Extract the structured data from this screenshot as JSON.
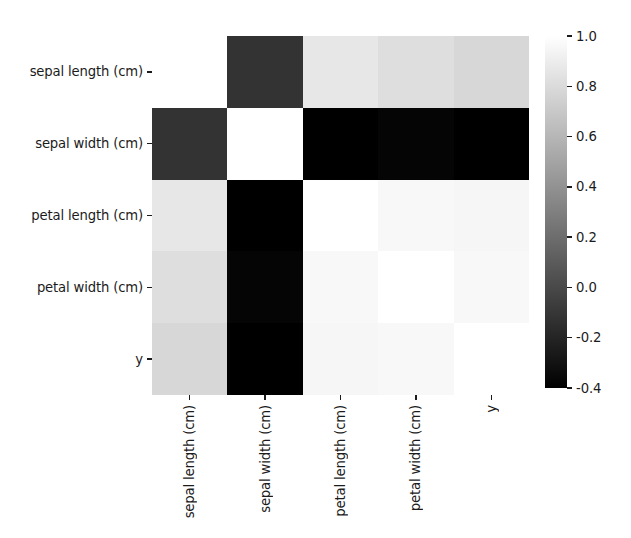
{
  "figure": {
    "kind": "correlation-heatmap",
    "background_color": "#ffffff",
    "text_color": "#1b1b1b"
  },
  "chart_data": {
    "type": "heatmap",
    "title": "",
    "xlabel": "",
    "ylabel": "",
    "colormap": "gray",
    "vmin": -0.4,
    "vmax": 1.0,
    "grid": false,
    "legend_position": "right",
    "x_categories": [
      "sepal length (cm)",
      "sepal width (cm)",
      "petal length (cm)",
      "petal width (cm)",
      "y"
    ],
    "y_categories": [
      "sepal length (cm)",
      "sepal width (cm)",
      "petal length (cm)",
      "petal width (cm)",
      "y"
    ],
    "values": [
      [
        1.0,
        -0.12,
        0.87,
        0.82,
        0.78
      ],
      [
        -0.12,
        1.0,
        -0.43,
        -0.37,
        -0.43
      ],
      [
        0.87,
        -0.43,
        1.0,
        0.96,
        0.95
      ],
      [
        0.82,
        -0.37,
        0.96,
        1.0,
        0.96
      ],
      [
        0.78,
        -0.43,
        0.95,
        0.96,
        1.0
      ]
    ],
    "colorbar": {
      "ticks": [
        "1.0",
        "0.8",
        "0.6",
        "0.4",
        "0.2",
        "0.0",
        "-0.2",
        "-0.4"
      ],
      "tick_values": [
        1.0,
        0.8,
        0.6,
        0.4,
        0.2,
        0.0,
        -0.2,
        -0.4
      ],
      "orientation": "vertical",
      "low_color": "#000000",
      "high_color": "#ffffff"
    }
  }
}
